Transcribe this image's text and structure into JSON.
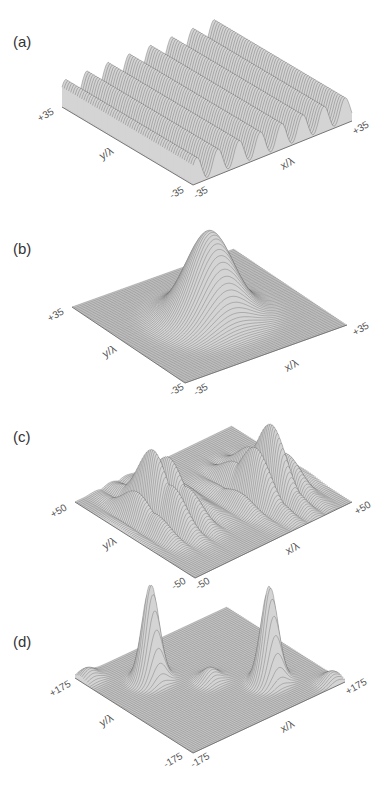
{
  "figure": {
    "panels": [
      {
        "label": "(a)",
        "y_axis_label": "y/λ",
        "x_axis_label": "x/λ",
        "y_max_tick": "+35",
        "y_min_tick": "-35",
        "x_min_tick": "-35",
        "x_max_tick": "+35",
        "surface": "parallel sinusoidal ridges"
      },
      {
        "label": "(b)",
        "y_axis_label": "y/λ",
        "x_axis_label": "x/λ",
        "y_max_tick": "+35",
        "y_min_tick": "-35",
        "x_min_tick": "-35",
        "x_max_tick": "+35",
        "surface": "single central gaussian peak"
      },
      {
        "label": "(c)",
        "y_axis_label": "y/λ",
        "x_axis_label": "x/λ",
        "y_max_tick": "+50",
        "y_min_tick": "-50",
        "x_min_tick": "-50",
        "x_max_tick": "+50",
        "surface": "two clusters of interference fringes"
      },
      {
        "label": "(d)",
        "y_axis_label": "y/λ",
        "x_axis_label": "x/λ",
        "y_max_tick": "+175",
        "y_min_tick": "-175",
        "x_min_tick": "-175",
        "x_max_tick": "+175",
        "surface": "two tall peaks with three small side lobes"
      }
    ]
  },
  "colors": {
    "axis": "#777777",
    "mesh": "#2a2a2a",
    "surface_fill": "#bdbdbd",
    "text": "#555555"
  }
}
